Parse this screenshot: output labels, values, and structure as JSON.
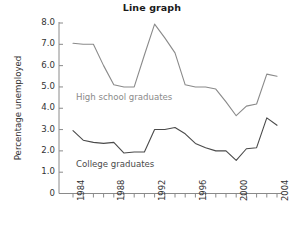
{
  "chart_data": {
    "type": "line",
    "title": "Line graph",
    "xlabel": "",
    "ylabel": "Percentage unemployed",
    "grid": false,
    "legend_position": "inline-annotation",
    "xlim": [
      1984,
      2004
    ],
    "ylim": [
      0,
      8
    ],
    "yticks": [
      "0",
      "1.0",
      "2.0",
      "3.0",
      "4.0",
      "5.0",
      "6.0",
      "7.0",
      "8.0"
    ],
    "ytick_values": [
      0,
      1,
      2,
      3,
      4,
      5,
      6,
      7,
      8
    ],
    "x": [
      1984,
      1985,
      1986,
      1987,
      1988,
      1989,
      1990,
      1991,
      1992,
      1993,
      1994,
      1995,
      1996,
      1997,
      1998,
      1999,
      2000,
      2001,
      2002,
      2003,
      2004
    ],
    "xtick_labels": [
      "1984",
      "",
      "",
      "",
      "1988",
      "",
      "",
      "",
      "1992",
      "",
      "",
      "",
      "1996",
      "",
      "",
      "",
      "2000",
      "",
      "",
      "",
      "2004"
    ],
    "xtick_labels_shown": [
      "1984",
      "1988",
      "1992",
      "1996",
      "2000",
      "2004"
    ],
    "series": [
      {
        "name": "High school graduates",
        "color": "#8a8a8a",
        "values": [
          7.05,
          7.0,
          7.0,
          6.0,
          5.1,
          5.0,
          5.0,
          6.5,
          7.95,
          7.3,
          6.6,
          5.1,
          5.0,
          5.0,
          4.9,
          4.3,
          3.65,
          4.1,
          4.2,
          5.6,
          5.5
        ]
      },
      {
        "name": "College graduates",
        "color": "#4a4a4a",
        "values": [
          2.95,
          2.5,
          2.4,
          2.35,
          2.4,
          1.9,
          1.95,
          1.95,
          3.0,
          3.0,
          3.1,
          2.8,
          2.35,
          2.15,
          2.0,
          2.0,
          1.55,
          2.1,
          2.15,
          3.55,
          3.2
        ]
      }
    ],
    "annotations": [
      {
        "text": "High school graduates",
        "color": "#8a8a8a"
      },
      {
        "text": "College graduates",
        "color": "#4a4a4a"
      }
    ]
  },
  "axis": {
    "color": "#8a8a8a"
  }
}
